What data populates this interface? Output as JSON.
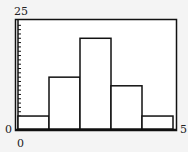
{
  "chart_data": {
    "type": "bar",
    "subtype": "histogram",
    "title": "",
    "xlabel": "",
    "ylabel": "",
    "bins": [
      [
        0,
        1
      ],
      [
        1,
        2
      ],
      [
        2,
        3
      ],
      [
        3,
        4
      ],
      [
        4,
        5
      ]
    ],
    "categories": [
      "0-1",
      "1-2",
      "2-3",
      "3-4",
      "4-5"
    ],
    "values": [
      3,
      12,
      21,
      10,
      3
    ],
    "xlim": [
      0,
      5
    ],
    "ylim": [
      0,
      25
    ],
    "ytick_interval": 1,
    "grid": false,
    "legend": null
  },
  "labels": {
    "y_max": "25",
    "y_min": "0",
    "x_min": "0",
    "x_max": "5"
  },
  "colors": {
    "frame": "#111111",
    "bar_fill": "#ffffff",
    "bar_stroke": "#111111",
    "background": "#f4f4f4"
  }
}
